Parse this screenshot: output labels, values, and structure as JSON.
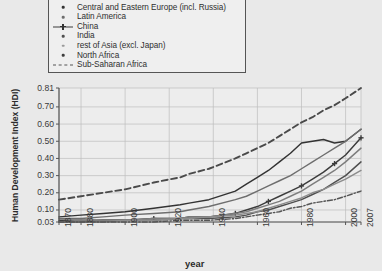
{
  "chart_data": {
    "type": "line",
    "title": "",
    "xlabel": "year",
    "ylabel": "Human Development Index (HDI)",
    "xlim": [
      1870,
      2007
    ],
    "ylim": [
      0.03,
      0.81
    ],
    "grid": true,
    "legend_position": "top-left-outside",
    "xticks": [
      "1870",
      "1880",
      "1900",
      "1920",
      "1940",
      "1960",
      "1980",
      "2000",
      "2007"
    ],
    "xtick_values": [
      1870,
      1880,
      1900,
      1920,
      1940,
      1960,
      1980,
      2000,
      2007
    ],
    "yticks": [
      "0.03",
      "0.10",
      "0.20",
      "0.30",
      "0.40",
      "0.50",
      "0.60",
      "0.70",
      "0.81"
    ],
    "ytick_values": [
      0.03,
      0.1,
      0.2,
      0.3,
      0.4,
      0.5,
      0.6,
      0.7,
      0.81
    ],
    "x": [
      1870,
      1880,
      1890,
      1900,
      1913,
      1925,
      1929,
      1938,
      1950,
      1955,
      1960,
      1965,
      1970,
      1975,
      1980,
      1985,
      1990,
      1995,
      2000,
      2007
    ],
    "series": [
      {
        "name": "OECD",
        "marker": "dashed-line",
        "color": "#4a4a4a",
        "values": [
          0.16,
          0.18,
          0.2,
          0.22,
          0.26,
          0.29,
          0.31,
          0.34,
          0.4,
          0.43,
          0.46,
          0.49,
          0.53,
          0.57,
          0.61,
          0.64,
          0.68,
          0.71,
          0.75,
          0.81
        ]
      },
      {
        "name": "Central and Eastern Europe (incl. Russia)",
        "marker": "dot-line",
        "color": "#333333",
        "values": [
          0.06,
          0.07,
          0.08,
          0.09,
          0.11,
          0.13,
          0.14,
          0.16,
          0.21,
          0.25,
          0.29,
          0.33,
          0.38,
          0.43,
          0.49,
          0.5,
          0.51,
          0.49,
          0.5,
          0.57
        ]
      },
      {
        "name": "Latin America",
        "marker": "dot-line",
        "color": "#6e6e6e",
        "values": [
          0.05,
          0.05,
          0.06,
          0.07,
          0.08,
          0.09,
          0.1,
          0.12,
          0.16,
          0.18,
          0.21,
          0.24,
          0.27,
          0.3,
          0.34,
          0.38,
          0.42,
          0.46,
          0.5,
          0.57
        ]
      },
      {
        "name": "China",
        "marker": "plus-line",
        "color": "#3c3c3c",
        "values": [
          0.04,
          0.04,
          0.04,
          0.04,
          0.05,
          0.05,
          0.06,
          0.06,
          0.08,
          0.1,
          0.12,
          0.15,
          0.18,
          0.21,
          0.24,
          0.28,
          0.32,
          0.37,
          0.42,
          0.52
        ]
      },
      {
        "name": "India",
        "marker": "dot-line",
        "color": "#4f4f4f",
        "values": [
          0.03,
          0.03,
          0.04,
          0.04,
          0.04,
          0.05,
          0.05,
          0.05,
          0.06,
          0.07,
          0.09,
          0.1,
          0.12,
          0.14,
          0.16,
          0.19,
          0.22,
          0.26,
          0.3,
          0.38
        ]
      },
      {
        "name": "rest of Asia (excl. Japan)",
        "marker": "dot-line",
        "color": "#7d7d7d",
        "values": [
          0.03,
          0.04,
          0.04,
          0.04,
          0.05,
          0.05,
          0.06,
          0.06,
          0.08,
          0.09,
          0.11,
          0.13,
          0.15,
          0.18,
          0.21,
          0.25,
          0.29,
          0.33,
          0.38,
          0.46
        ]
      },
      {
        "name": "North Africa",
        "marker": "dot-line",
        "color": "#8c8c8c",
        "values": [
          0.03,
          0.03,
          0.03,
          0.04,
          0.04,
          0.05,
          0.05,
          0.06,
          0.07,
          0.08,
          0.09,
          0.11,
          0.13,
          0.15,
          0.17,
          0.2,
          0.22,
          0.25,
          0.28,
          0.33
        ]
      },
      {
        "name": "Sub-Saharan Africa",
        "marker": "dashdot-line",
        "color": "#555555",
        "values": [
          0.03,
          0.03,
          0.03,
          0.03,
          0.03,
          0.04,
          0.04,
          0.04,
          0.05,
          0.06,
          0.07,
          0.08,
          0.09,
          0.11,
          0.12,
          0.14,
          0.15,
          0.16,
          0.18,
          0.21
        ]
      }
    ]
  },
  "legend": {
    "items": [
      {
        "label": "OECD",
        "marker": "dashed-line"
      },
      {
        "label": "Central and Eastern Europe (incl. Russia)",
        "marker": "dot"
      },
      {
        "label": "Latin America",
        "marker": "dot"
      },
      {
        "label": "China",
        "marker": "plus-line"
      },
      {
        "label": "India",
        "marker": "dot"
      },
      {
        "label": "rest of Asia (excl. Japan)",
        "marker": "dot"
      },
      {
        "label": "North Africa",
        "marker": "dot"
      },
      {
        "label": "Sub-Saharan Africa",
        "marker": "dashdot-line"
      }
    ]
  },
  "colors": {
    "background": "#e9e9e9",
    "plot_background": "#ededed",
    "grid": "#bdbdbd",
    "axis": "#555555",
    "text": "#3a3a3a"
  }
}
